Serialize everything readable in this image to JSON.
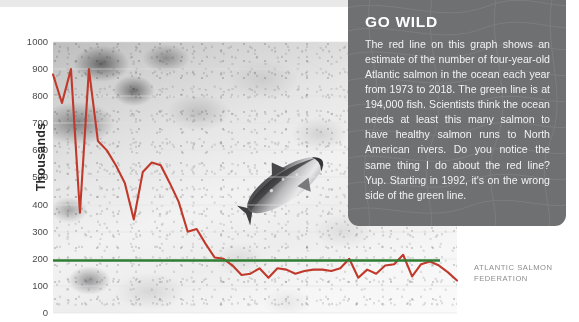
{
  "figure": {
    "credit": "ATLANTIC SALMON FEDERATION",
    "credit_line1": "ATLANTIC SALMON",
    "credit_line2": "FEDERATION"
  },
  "callout": {
    "title": "GO WILD",
    "body": "The red line on this graph shows an estimate of the number of four-year-old Atlantic salmon in the ocean each year from 1973 to 2018. The green line is at 194,000 fish. Scientists think the ocean needs at least this many salmon to have healthy salmon runs to North American rivers. Do you notice the same thing I do about the red line? Yup. Starting in 1992, it's on the wrong side of the green line.",
    "background_color": "#6f7072",
    "title_color": "#ffffff",
    "text_color": "#f2f2f2"
  },
  "chart_data": {
    "type": "line",
    "title": "",
    "xlabel": "",
    "ylabel": "Thousands",
    "ylim": [
      0,
      1000
    ],
    "xlim": [
      1973,
      2018
    ],
    "ytick_labels": [
      "1000",
      "900",
      "800",
      "700",
      "600",
      "500",
      "400",
      "300",
      "200",
      "100",
      "0"
    ],
    "ytick_values": [
      1000,
      900,
      800,
      700,
      600,
      500,
      400,
      300,
      200,
      100,
      0
    ],
    "xtick_labels": [],
    "grid": false,
    "legend": "none",
    "x": [
      1973,
      1974,
      1975,
      1976,
      1977,
      1978,
      1979,
      1980,
      1981,
      1982,
      1983,
      1984,
      1985,
      1986,
      1987,
      1988,
      1989,
      1990,
      1991,
      1992,
      1993,
      1994,
      1995,
      1996,
      1997,
      1998,
      1999,
      2000,
      2001,
      2002,
      2003,
      2004,
      2005,
      2006,
      2007,
      2008,
      2009,
      2010,
      2011,
      2012,
      2013,
      2014,
      2015,
      2016,
      2017,
      2018
    ],
    "series": [
      {
        "name": "Estimated four-year-old Atlantic salmon in the ocean",
        "color": "#c0392b",
        "units": "thousands of fish",
        "values": [
          880,
          775,
          900,
          370,
          900,
          635,
          600,
          545,
          480,
          345,
          520,
          555,
          545,
          480,
          410,
          300,
          310,
          255,
          205,
          200,
          175,
          140,
          145,
          165,
          130,
          165,
          160,
          145,
          155,
          160,
          160,
          155,
          165,
          200,
          130,
          160,
          145,
          175,
          180,
          215,
          135,
          180,
          190,
          175,
          150,
          120
        ]
      },
      {
        "name": "Conservation requirement",
        "color": "#2e7d32",
        "units": "thousands of fish",
        "constant_value": 194,
        "label": "194,000 fish"
      }
    ],
    "annotations": [
      {
        "text": "green line at 194,000 fish",
        "type": "threshold"
      },
      {
        "text": "red line falls below threshold starting in 1992",
        "type": "note"
      }
    ]
  }
}
